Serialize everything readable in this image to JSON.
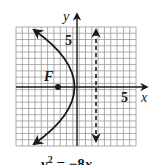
{
  "chart_data": {
    "type": "diagram",
    "title": "",
    "equation": {
      "lhs_var": "y",
      "lhs_exp": "2",
      "equals": "=",
      "rhs": "−8",
      "rhs_var": "x"
    },
    "equation_text": "y² = −8x",
    "axes": {
      "x_label": "x",
      "y_label": "y",
      "x_tick_label": "5",
      "y_tick_label": "5",
      "x_range": [
        -10,
        10
      ],
      "y_range": [
        -10,
        10
      ],
      "grid": true
    },
    "focus": {
      "label": "F",
      "x": -2,
      "y": 0
    },
    "directrix": {
      "x": 2,
      "style": "dashed",
      "arrows": "both"
    },
    "vertex": {
      "x": 0,
      "y": 0
    },
    "curve": {
      "opens": "left",
      "arrows": "both ends"
    }
  },
  "labels": {
    "x_axis": "x",
    "y_axis": "y",
    "x_five": "5",
    "y_five": "5",
    "focus": "F"
  },
  "colors": {
    "ink": "#1a1a1a",
    "grid": "#9a9a9a",
    "background": "#ffffff"
  }
}
